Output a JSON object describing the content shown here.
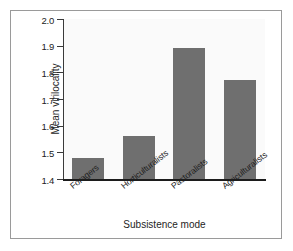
{
  "figure": {
    "background_color": "#ffffff",
    "frame_color": "#9a9a9a",
    "panel_color": "#fafafa"
  },
  "chart_data": {
    "type": "bar",
    "title": "",
    "subtitle": "",
    "xlabel": "Subsistence mode",
    "ylabel": "Mean virilocality",
    "categories": [
      "Foragers",
      "Horticulturalists",
      "Pastoralists",
      "Agriculturalists"
    ],
    "values": [
      1.48,
      1.56,
      1.89,
      1.77
    ],
    "series": [
      {
        "name": "Mean virilocality",
        "values": [
          1.48,
          1.56,
          1.89,
          1.77
        ],
        "color": "#6f6f6f"
      }
    ],
    "ylim": [
      1.4,
      2.0
    ],
    "ytick_labels": [
      "1.4",
      "1.5",
      "1.6",
      "1.7",
      "1.8",
      "1.9",
      "2.0"
    ],
    "ytick_values": [
      1.4,
      1.5,
      1.6,
      1.7,
      1.8,
      1.9,
      2.0
    ],
    "xtick_labels": [
      "Foragers",
      "Horticulturalists",
      "Pastoralists",
      "Agriculturalists"
    ],
    "grid": false,
    "legend": false,
    "legend_position": "none",
    "bar_color": "#6f6f6f",
    "xtick_label_rotation": -38
  }
}
